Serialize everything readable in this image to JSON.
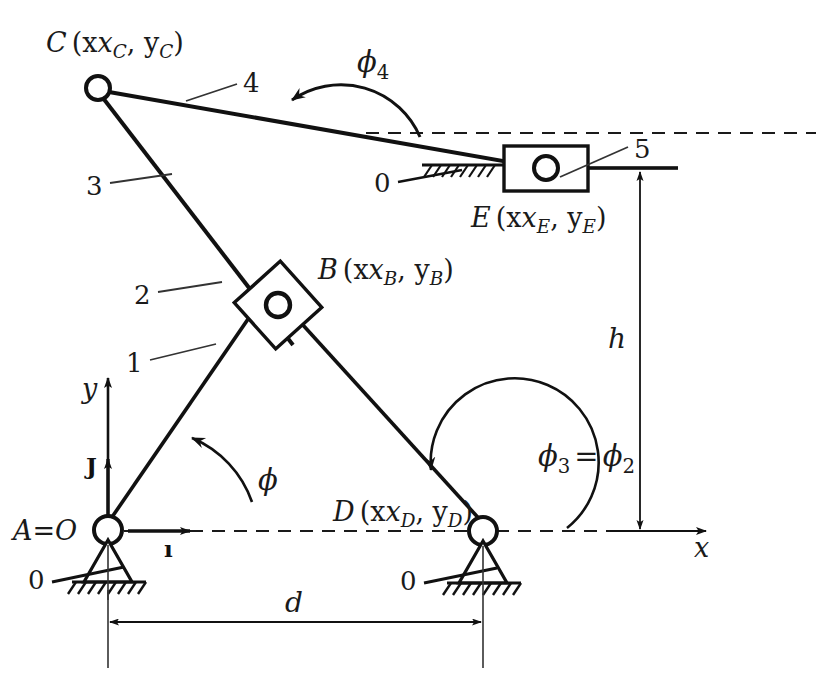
{
  "figure": {
    "type": "kinematic-diagram",
    "title": ""
  },
  "labels": {
    "joint_C": "C",
    "joint_C_coords": "(x",
    "joint_B": "B",
    "joint_D": "D",
    "joint_E": "E",
    "joint_A": "A=O",
    "sub_C": "C",
    "sub_B": "B",
    "sub_D": "D",
    "sub_E": "E",
    "comma_y": ", y",
    "paren_close": ")",
    "link_1": "1",
    "link_2": "2",
    "link_3": "3",
    "link_4": "4",
    "link_5": "5",
    "ground_0_A": "0",
    "ground_0_D": "0",
    "ground_0_E": "0",
    "axis_x": "x",
    "axis_y": "y",
    "unit_i": "ı",
    "unit_j": "J",
    "angle_phi": "ϕ",
    "angle_phi4": "ϕ",
    "angle_phi4_sub": "4",
    "angle_phi3": "ϕ",
    "angle_phi3_sub": "3",
    "angle_equals": "=",
    "angle_phi2": "ϕ",
    "angle_phi2_sub": "2",
    "dim_d": "d",
    "dim_h": "h"
  },
  "geometry": {
    "point_A": [
      108,
      530
    ],
    "point_B": [
      278,
      305
    ],
    "point_C": [
      98,
      88
    ],
    "point_D": [
      483,
      531
    ],
    "point_E": [
      546,
      168
    ],
    "slider_E_box": [
      504,
      146,
      84,
      45
    ],
    "slider_B_size": 62,
    "joint_radius": 12
  },
  "colors": {
    "ink": "#111111",
    "line": "#1a1a1a",
    "paper": "#ffffff",
    "leader": "#333333"
  }
}
